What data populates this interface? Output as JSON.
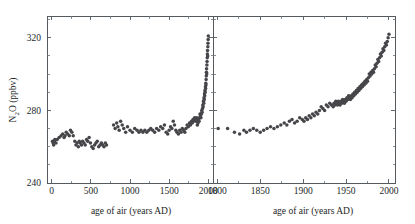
{
  "chart_data": {
    "type": "scatter",
    "title": "",
    "subtitle": "",
    "ylabel": "N₂O (ppbv)",
    "ylabel_parts": {
      "pre": "N",
      "sub": "2",
      "post": "O (ppbv)"
    },
    "ylim": [
      240,
      332
    ],
    "yticks": [
      240,
      280,
      320
    ],
    "ytick_labels": [
      "240",
      "280",
      "320"
    ],
    "ytick_minor": [
      250,
      260,
      270,
      290,
      300,
      310,
      330
    ],
    "grid": false,
    "legend": null,
    "marker_color": "#46464a",
    "axis_color": "#555a5e",
    "panels": [
      {
        "name": "left-panel",
        "xlabel": "age of air (years AD)",
        "xlim": [
          -60,
          2060
        ],
        "xticks": [
          0,
          500,
          1000,
          1500,
          2000
        ],
        "xtick_labels": [
          "0",
          "500",
          "1000",
          "1500",
          "2000"
        ],
        "xtick_minor": [
          250,
          750,
          1250,
          1750
        ],
        "series": [
          {
            "name": "N2O ice core record",
            "x": [
              10,
              18,
              25,
              32,
              40,
              55,
              70,
              95,
              120,
              140,
              158,
              170,
              185,
              205,
              225,
              240,
              258,
              275,
              295,
              310,
              325,
              340,
              352,
              365,
              380,
              395,
              412,
              428,
              445,
              460,
              478,
              495,
              512,
              530,
              548,
              565,
              582,
              600,
              618,
              635,
              652,
              668,
              685,
              700,
              790,
              810,
              830,
              845,
              862,
              880,
              900,
              920,
              945,
              968,
              1000,
              1030,
              1060,
              1090,
              1115,
              1140,
              1165,
              1190,
              1215,
              1240,
              1265,
              1290,
              1315,
              1340,
              1368,
              1392,
              1418,
              1440,
              1462,
              1482,
              1500,
              1518,
              1535,
              1552,
              1568,
              1585,
              1600,
              1618,
              1635,
              1652,
              1668,
              1685,
              1700,
              1715,
              1730,
              1745,
              1760,
              1772,
              1785,
              1795,
              1805,
              1815,
              1825,
              1835,
              1845,
              1852,
              1860,
              1868,
              1875,
              1882,
              1888,
              1894,
              1900,
              1906,
              1911,
              1916,
              1921,
              1926,
              1930,
              1934,
              1938,
              1942,
              1945,
              1948,
              1951,
              1954,
              1957,
              1960,
              1963,
              1966,
              1968,
              1970,
              1972,
              1974,
              1976,
              1978,
              1980,
              1982,
              1984,
              1986,
              1988,
              1990,
              1992,
              1994,
              1996,
              1998,
              2000
            ],
            "y": [
              263,
              262,
              261,
              263,
              264,
              262,
              264,
              265,
              266,
              267,
              265,
              266,
              268,
              267,
              266,
              269,
              268,
              266,
              263,
              261,
              262,
              260,
              263,
              262,
              261,
              263,
              262,
              261,
              264,
              263,
              265,
              262,
              260,
              259,
              261,
              262,
              263,
              260,
              261,
              262,
              261,
              260,
              262,
              261,
              272,
              270,
              273,
              271,
              269,
              274,
              272,
              270,
              268,
              271,
              269,
              268,
              270,
              269,
              268,
              269,
              268,
              269,
              268,
              269,
              270,
              269,
              268,
              270,
              269,
              271,
              270,
              272,
              268,
              267,
              269,
              271,
              270,
              274,
              272,
              269,
              268,
              267,
              269,
              268,
              270,
              269,
              268,
              270,
              272,
              271,
              273,
              272,
              274,
              273,
              275,
              274,
              276,
              275,
              274,
              276,
              272,
              273,
              275,
              274,
              276,
              278,
              277,
              276,
              278,
              280,
              279,
              281,
              283,
              282,
              285,
              284,
              287,
              286,
              289,
              288,
              291,
              290,
              293,
              292,
              295,
              294,
              297,
              299,
              301,
              303,
              300,
              305,
              307,
              309,
              311,
              313,
              310,
              315,
              317,
              319,
              321,
              323,
              325
            ]
          }
        ]
      },
      {
        "name": "right-panel",
        "xlabel": "age of air (years AD)",
        "xlim": [
          1795,
          2007
        ],
        "xticks": [
          1800,
          1850,
          1900,
          1950,
          2000
        ],
        "xtick_labels": [
          "1800",
          "1850",
          "1900",
          "1950",
          "2000"
        ],
        "xtick_minor": [
          1825,
          1875,
          1925,
          1975
        ],
        "series": [
          {
            "name": "N2O ice core and firn record",
            "x": [
              1801,
              1812,
              1820,
              1826,
              1831,
              1834,
              1838,
              1842,
              1846,
              1850,
              1854,
              1858,
              1862,
              1866,
              1870,
              1874,
              1878,
              1881,
              1884,
              1887,
              1890,
              1893,
              1896,
              1899,
              1901,
              1903,
              1905,
              1907,
              1909,
              1911,
              1913,
              1915,
              1917,
              1919,
              1921,
              1923,
              1925,
              1927,
              1929,
              1931,
              1933,
              1935,
              1936,
              1937,
              1938,
              1939,
              1940,
              1941,
              1942,
              1943,
              1944,
              1945,
              1946,
              1947,
              1948,
              1949,
              1950,
              1951,
              1952,
              1953,
              1954,
              1955,
              1956,
              1957,
              1958,
              1959,
              1960,
              1961,
              1962,
              1963,
              1964,
              1965,
              1966,
              1967,
              1968,
              1969,
              1970,
              1971,
              1972,
              1973,
              1974,
              1975,
              1976,
              1977,
              1978,
              1979,
              1980,
              1981,
              1982,
              1983,
              1984,
              1985,
              1986,
              1987,
              1988,
              1989,
              1990,
              1991,
              1992,
              1993,
              1994,
              1995,
              1996,
              1997,
              1998,
              1999,
              2000
            ],
            "y": [
              270,
              270,
              268,
              267,
              269,
              268,
              269,
              270,
              269,
              268,
              269,
              270,
              271,
              270,
              271,
              272,
              273,
              272,
              274,
              275,
              273,
              274,
              276,
              275,
              274,
              276,
              275,
              277,
              276,
              278,
              277,
              279,
              278,
              280,
              282,
              281,
              280,
              283,
              282,
              284,
              283,
              282,
              284,
              283,
              285,
              284,
              283,
              285,
              284,
              283,
              285,
              284,
              286,
              285,
              284,
              286,
              285,
              287,
              286,
              288,
              287,
              286,
              288,
              287,
              289,
              288,
              290,
              289,
              291,
              290,
              292,
              291,
              293,
              292,
              294,
              293,
              295,
              294,
              296,
              295,
              297,
              296,
              298,
              300,
              299,
              301,
              300,
              302,
              301,
              303,
              305,
              304,
              306,
              308,
              307,
              309,
              311,
              310,
              312,
              314,
              313,
              315,
              317,
              316,
              318,
              320,
              322
            ]
          }
        ]
      }
    ]
  }
}
